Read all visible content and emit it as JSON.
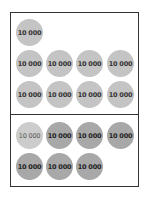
{
  "top_group": {
    "coins": [
      {
        "label": "10 000"
      },
      {
        "label": "10 000"
      },
      {
        "label": "10 000"
      },
      {
        "label": "10 000"
      },
      {
        "label": "10 000"
      },
      {
        "label": "10 000"
      },
      {
        "label": "10 000"
      },
      {
        "label": "10 000"
      },
      {
        "label": "10 000"
      }
    ]
  },
  "bottom_group": {
    "coins": [
      {
        "label": "10 000"
      },
      {
        "label": "10 000"
      },
      {
        "label": "10 000"
      },
      {
        "label": "10 000"
      },
      {
        "label": "10 000"
      },
      {
        "label": "10 000"
      },
      {
        "label": "10 000"
      }
    ]
  },
  "colors": {
    "light_coin": "#c4c4c4",
    "dark_coin": "#a8a8a8",
    "border": "#333333"
  }
}
